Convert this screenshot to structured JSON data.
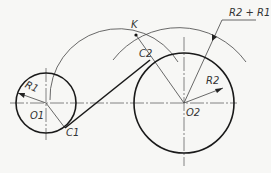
{
  "diagram": {
    "type": "geometric-construction",
    "labels": {
      "o1": "O1",
      "o2": "O2",
      "c1": "C1",
      "c2": "C2",
      "k": "K",
      "r1": "R1",
      "r2": "R2",
      "r_sum": "R2 + R1"
    },
    "colors": {
      "stroke": "#1a1a1a",
      "thin": "#444444",
      "center_line": "#666666",
      "background": "#f7f7f5"
    }
  }
}
